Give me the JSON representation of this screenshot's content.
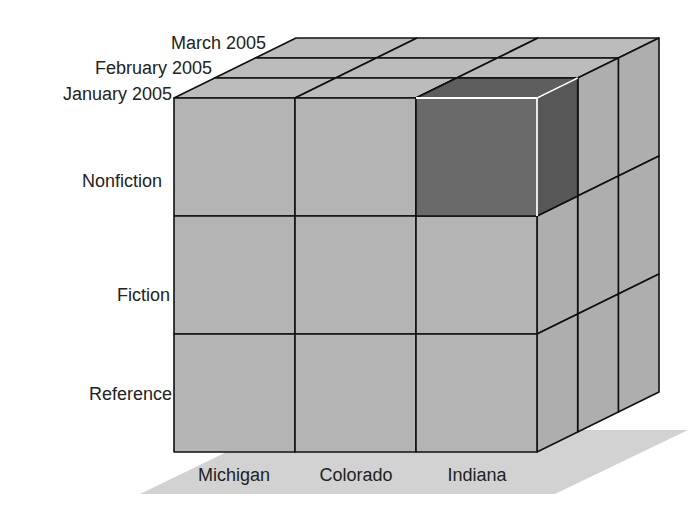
{
  "caption": "gory ... (cropped caption text)",
  "diagram": {
    "type": "olap-data-cube",
    "dimensions": {
      "rows": {
        "name": "category",
        "members": [
          "Nonfiction",
          "Fiction",
          "Reference"
        ]
      },
      "columns": {
        "name": "state",
        "members": [
          "Michigan",
          "Colorado",
          "Indiana"
        ]
      },
      "depth": {
        "name": "month",
        "members": [
          "January 2005",
          "February 2005",
          "March 2005"
        ]
      }
    },
    "highlighted_cell": {
      "row": "Nonfiction",
      "column": "Indiana",
      "depth": "January 2005"
    },
    "colors": {
      "cube_face": "#b4b4b4",
      "cube_top": "#bcbcbc",
      "cube_side": "#aeaeae",
      "highlight_front": "#6a6a6a",
      "highlight_top": "#5e5e5e",
      "highlight_side": "#575757",
      "highlight_edge": "#ffffff",
      "grid_line": "#111111",
      "shadow": "#d2d2d2"
    }
  }
}
